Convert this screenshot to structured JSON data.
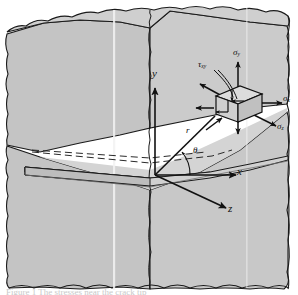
{
  "axes": {
    "y_label": "y",
    "x_label": "x",
    "z_label": "z"
  },
  "polar": {
    "radius_label": "r",
    "angle_label": "θ"
  },
  "stresses": {
    "sigma_y": {
      "symbol": "σ",
      "subscript": "y"
    },
    "sigma_x": {
      "symbol": "σ",
      "subscript": "x"
    },
    "sigma_z": {
      "symbol": "σ",
      "subscript": "z"
    },
    "tau_xy": {
      "symbol": "τ",
      "subscript": "xy"
    }
  },
  "caption": "Figure 1 The stresses near the crack tip",
  "colors": {
    "block_face_light": "#d2d2d2",
    "block_face_mid": "#c6c6c6",
    "block_face_dark": "#b9b9b9",
    "slab_top": "#d8d8d8",
    "slab_edge": "#a8a8a8",
    "outline": "#1a1a1a",
    "cube_face": "#d8d8d8",
    "cube_side": "#bdbdbd",
    "highlight_stripe": "#f2f2f2",
    "background": "#ffffff"
  }
}
